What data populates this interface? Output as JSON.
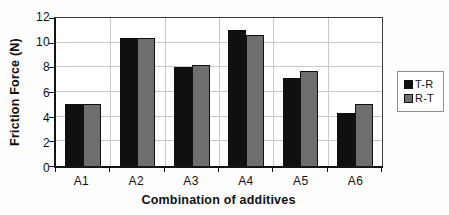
{
  "chart_data": {
    "type": "bar",
    "title": "",
    "xlabel": "Combination of additives",
    "ylabel": "Friction Force (N)",
    "categories": [
      "A1",
      "A2",
      "A3",
      "A4",
      "A5",
      "A6"
    ],
    "series": [
      {
        "name": "T-R",
        "color": "#101010",
        "values": [
          5.0,
          10.4,
          8.0,
          11.0,
          7.1,
          4.3
        ]
      },
      {
        "name": "R-T",
        "color": "#6e6e6e",
        "values": [
          5.05,
          10.35,
          8.2,
          10.6,
          7.7,
          5.0
        ]
      }
    ],
    "ylim": [
      0,
      12
    ],
    "yticks": [
      0,
      2,
      4,
      6,
      8,
      10,
      12
    ],
    "grid": true,
    "legend_position": "right"
  },
  "colors": {
    "gridline": "#c9c9c9",
    "axis": "#141414",
    "text": "#111111",
    "legend_border": "#8f8f8f",
    "plot_background": "#ffffff"
  }
}
